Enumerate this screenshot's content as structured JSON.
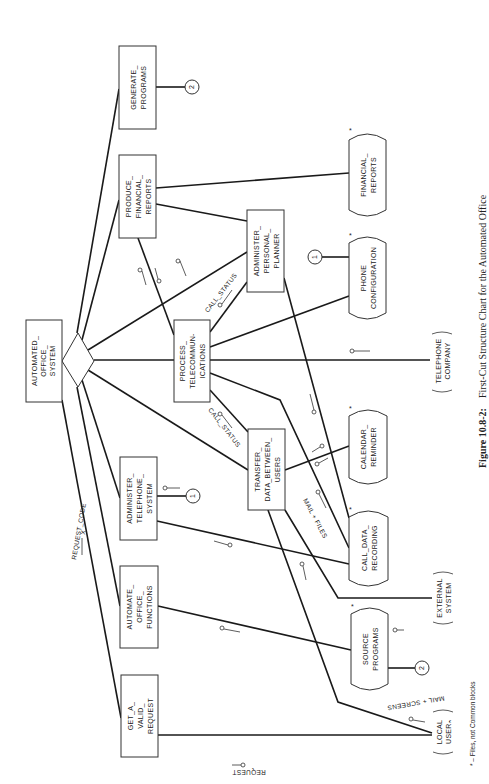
{
  "figure": {
    "number": "Figure 10.8-2:",
    "caption": "First-Cut Structure Chart for the Automated Office",
    "footnote": "* – Files, not Common blocks"
  },
  "modules": {
    "root": [
      "AUTOMATED_",
      "OFFICE_",
      "SYSTEM"
    ],
    "generate_programs": [
      "GENERATE_",
      "PROGRAMS"
    ],
    "produce_financial_reports": [
      "PRODUCE_",
      "FINANCIAL_",
      "REPORTS"
    ],
    "process_telecommunications": [
      "PROCESS_",
      "TELECOMMUN-",
      "ICATIONS"
    ],
    "administer_personal_planner": [
      "ADMINISTER_",
      "PERSONAL_",
      "PLANNER"
    ],
    "administer_telephone_system": [
      "ADMINISTER_",
      "TELEPHONE_",
      "SYSTEM"
    ],
    "transfer_data_between_users": [
      "TRANSFER_",
      "DATA_BETWEEN_",
      "USERS"
    ],
    "automate_office_functions": [
      "AUTOMATE_",
      "OFFICE_",
      "FUNCTIONS"
    ],
    "get_a_valid_request": [
      "GET_A_",
      "VALID_",
      "REQUEST"
    ]
  },
  "files": {
    "financial_reports": [
      "FINANCIAL_",
      "REPORTS"
    ],
    "phone_configuration": [
      "PHONE",
      "CONFIGURATION"
    ],
    "calendar_reminder": [
      "CALENDAR_",
      "REMINDER"
    ],
    "call_data_recording": [
      "CALL_DATA_",
      "RECORDING"
    ],
    "source_programs": [
      "SOURCE",
      "PROGRAMS"
    ],
    "file_marker": "*"
  },
  "externals": {
    "telephone_company": [
      "TELEPHONE",
      "COMPANY"
    ],
    "external_system": [
      "EXTERNAL",
      "SYSTEM"
    ],
    "local_user": [
      "LOCAL",
      "USERₙ"
    ]
  },
  "connectors": {
    "c1": "1",
    "c2": "2"
  },
  "flows": {
    "request_code": "REQUEST_CODE",
    "request_code_marker": "X",
    "call_status_upper": "CALL_STATUS",
    "call_status_lower": "CALL_STATUS",
    "mail_files": "MAIL + FILES",
    "mail_screens": "MAIL + SCREENS",
    "request": "REQUEST"
  }
}
